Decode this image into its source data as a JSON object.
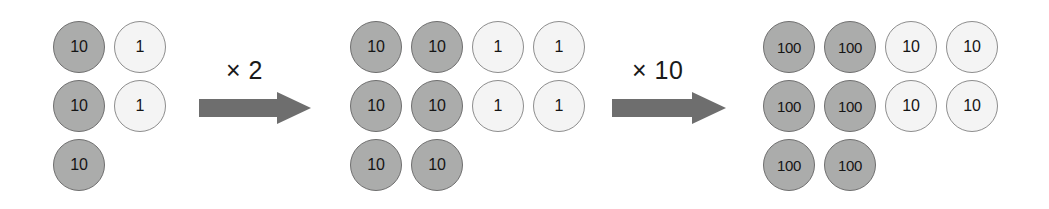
{
  "diagram": {
    "colors": {
      "counter_dark_fill": "#ABACAB",
      "counter_dark_stroke": "#6F6F6F",
      "counter_light_fill": "#F4F4F4",
      "counter_light_stroke": "#8D8D8D",
      "arrow_fill": "#6E6E6E",
      "text": "#151515",
      "background": "#FFFFFF"
    },
    "metrics": {
      "circle_diameter": 52,
      "column_pitch": 61,
      "row_pitch": 59
    },
    "groups": [
      {
        "name": "group-1",
        "origin_x": 53,
        "origin_y": 21,
        "counters": [
          {
            "value": "10",
            "tone": "dark",
            "col": 0,
            "row": 0
          },
          {
            "value": "10",
            "tone": "dark",
            "col": 0,
            "row": 1
          },
          {
            "value": "10",
            "tone": "dark",
            "col": 0,
            "row": 2
          },
          {
            "value": "1",
            "tone": "light",
            "col": 1,
            "row": 0
          },
          {
            "value": "1",
            "tone": "light",
            "col": 1,
            "row": 1
          }
        ]
      },
      {
        "name": "group-2",
        "origin_x": 350,
        "origin_y": 21,
        "counters": [
          {
            "value": "10",
            "tone": "dark",
            "col": 0,
            "row": 0
          },
          {
            "value": "10",
            "tone": "dark",
            "col": 0,
            "row": 1
          },
          {
            "value": "10",
            "tone": "dark",
            "col": 0,
            "row": 2
          },
          {
            "value": "10",
            "tone": "dark",
            "col": 1,
            "row": 0
          },
          {
            "value": "10",
            "tone": "dark",
            "col": 1,
            "row": 1
          },
          {
            "value": "10",
            "tone": "dark",
            "col": 1,
            "row": 2
          },
          {
            "value": "1",
            "tone": "light",
            "col": 2,
            "row": 0
          },
          {
            "value": "1",
            "tone": "light",
            "col": 2,
            "row": 1
          },
          {
            "value": "1",
            "tone": "light",
            "col": 3,
            "row": 0
          },
          {
            "value": "1",
            "tone": "light",
            "col": 3,
            "row": 1
          }
        ]
      },
      {
        "name": "group-3",
        "origin_x": 763,
        "origin_y": 21,
        "counters": [
          {
            "value": "100",
            "tone": "dark",
            "col": 0,
            "row": 0
          },
          {
            "value": "100",
            "tone": "dark",
            "col": 0,
            "row": 1
          },
          {
            "value": "100",
            "tone": "dark",
            "col": 0,
            "row": 2
          },
          {
            "value": "100",
            "tone": "dark",
            "col": 1,
            "row": 0
          },
          {
            "value": "100",
            "tone": "dark",
            "col": 1,
            "row": 1
          },
          {
            "value": "100",
            "tone": "dark",
            "col": 1,
            "row": 2
          },
          {
            "value": "10",
            "tone": "light",
            "col": 2,
            "row": 0
          },
          {
            "value": "10",
            "tone": "light",
            "col": 2,
            "row": 1
          },
          {
            "value": "10",
            "tone": "light",
            "col": 3,
            "row": 0
          },
          {
            "value": "10",
            "tone": "light",
            "col": 3,
            "row": 1
          }
        ]
      }
    ],
    "arrows": [
      {
        "name": "arrow-times-2",
        "label": "× 2",
        "x": 199,
        "y": 92,
        "width": 112,
        "height": 32,
        "label_x": 226,
        "label_y": 56
      },
      {
        "name": "arrow-times-10",
        "label": "× 10",
        "x": 612,
        "y": 92,
        "width": 114,
        "height": 32,
        "label_x": 632,
        "label_y": 56
      }
    ]
  }
}
